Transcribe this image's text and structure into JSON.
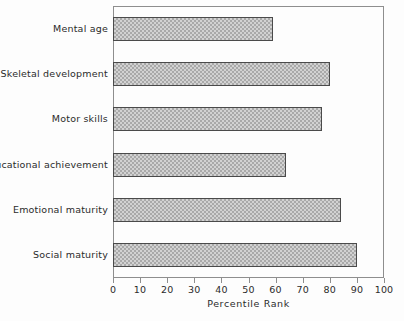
{
  "chart_data": {
    "type": "bar",
    "orientation": "horizontal",
    "title": "",
    "xlabel": "Percentile Rank",
    "ylabel": "",
    "xlim": [
      0,
      100
    ],
    "xticks": [
      0,
      10,
      20,
      30,
      40,
      50,
      60,
      70,
      80,
      90,
      100
    ],
    "xtick_labels": [
      "0",
      "10",
      "20",
      "30",
      "40",
      "50",
      "60",
      "70",
      "80",
      "90",
      "100"
    ],
    "grid": false,
    "legend": null,
    "categories": [
      "Mental age",
      "Skeletal development",
      "Motor skills",
      "Educational achievement",
      "Emotional maturity",
      "Social maturity"
    ],
    "values": [
      59,
      80,
      77,
      64,
      84,
      90
    ],
    "bar_fill": "#d2d2d2",
    "bar_pattern": "checkered-dither",
    "bar_edge_color": "#4a4a4a",
    "frame_color": "#8e8e8e"
  }
}
